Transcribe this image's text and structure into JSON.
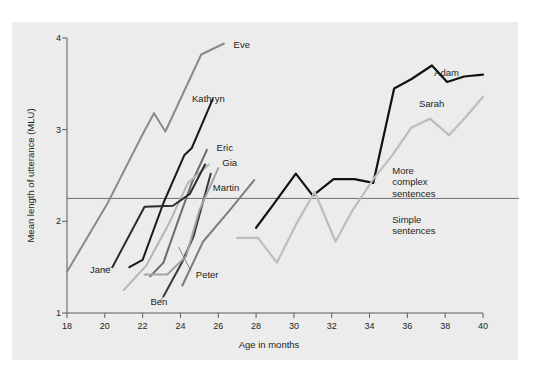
{
  "chart_data": {
    "type": "line",
    "title": "",
    "xlabel": "Age in months",
    "ylabel": "Mean length of utterance (MLU)",
    "xlim": [
      18,
      40
    ],
    "ylim": [
      1,
      4
    ],
    "xticks": [
      18,
      20,
      22,
      24,
      26,
      28,
      30,
      32,
      34,
      36,
      38,
      40
    ],
    "yticks": [
      1,
      2,
      3,
      4
    ],
    "grid": false,
    "legend": "inline-end-labels",
    "annotations": [
      {
        "text": "More\ncomplex\nsentences",
        "x": 35.2,
        "y": 2.55
      },
      {
        "text": "Simple\nsentences",
        "x": 35.2,
        "y": 2.02
      }
    ],
    "reference_lines": [
      {
        "orientation": "horizontal",
        "y": 2.25,
        "color": "#6d6d6d"
      }
    ],
    "series": [
      {
        "name": "Eve",
        "color": "#8a8a8a",
        "width": 2.0,
        "label_x": 26.6,
        "label_y": 3.92,
        "x": [
          18,
          20.1,
          22.0,
          22.6,
          23.2,
          25.1,
          26.3
        ],
        "y": [
          1.45,
          2.18,
          2.95,
          3.18,
          2.98,
          3.82,
          3.94
        ]
      },
      {
        "name": "Kathryn",
        "color": "#1a1a1a",
        "width": 2.0,
        "label_x": 24.4,
        "label_y": 3.33,
        "x": [
          21.3,
          22.0,
          23.1,
          24.2,
          24.6,
          25.7
        ],
        "y": [
          1.5,
          1.58,
          2.2,
          2.72,
          2.8,
          3.33
        ]
      },
      {
        "name": "Eric",
        "color": "#6b6b6b",
        "width": 2.0,
        "label_x": 25.7,
        "label_y": 2.8,
        "x": [
          22.4,
          23.1,
          23.9,
          24.6,
          25.4
        ],
        "y": [
          1.4,
          1.55,
          2.02,
          2.42,
          2.78
        ]
      },
      {
        "name": "Gia",
        "color": "#b5b5b5",
        "width": 2.0,
        "label_x": 26.0,
        "label_y": 2.64,
        "x": [
          21.0,
          22.2,
          23.4,
          24.4,
          25.5
        ],
        "y": [
          1.25,
          1.52,
          1.98,
          2.42,
          2.62
        ]
      },
      {
        "name": "Jane",
        "color": "#2c2c2c",
        "width": 2.0,
        "label_x": 19.0,
        "label_y": 1.47,
        "x": [
          20.4,
          22.1,
          23.6,
          24.5,
          25.3
        ],
        "y": [
          1.5,
          2.16,
          2.17,
          2.3,
          2.62
        ]
      },
      {
        "name": "Ben",
        "color": "#3a3a3a",
        "width": 2.0,
        "label_x": 22.2,
        "label_y": 1.12,
        "x": [
          23.1,
          24.1,
          24.7,
          25.6
        ],
        "y": [
          1.18,
          1.56,
          1.84,
          2.52
        ]
      },
      {
        "name": "Peter",
        "color": "#a3a3a3",
        "width": 2.0,
        "label_x": 24.6,
        "label_y": 1.42,
        "x": [
          22.1,
          23.3,
          24.3,
          25.0,
          26.0
        ],
        "y": [
          1.42,
          1.42,
          1.62,
          2.12,
          2.58
        ]
      },
      {
        "name": "Martin",
        "color": "#7d7d7d",
        "width": 2.0,
        "label_x": 25.5,
        "label_y": 2.36,
        "x": [
          24.1,
          25.2,
          26.6,
          27.9
        ],
        "y": [
          1.3,
          1.78,
          2.12,
          2.45
        ]
      },
      {
        "name": "Adam",
        "color": "#121212",
        "width": 2.2,
        "label_x": 37.2,
        "label_y": 3.62,
        "x": [
          28.0,
          28.9,
          30.1,
          31.0,
          32.1,
          33.2,
          34.2,
          35.3,
          36.2,
          37.3,
          38.1,
          39.0,
          40.0
        ],
        "y": [
          1.93,
          2.18,
          2.52,
          2.28,
          2.46,
          2.46,
          2.42,
          3.45,
          3.55,
          3.7,
          3.52,
          3.58,
          3.6
        ]
      },
      {
        "name": "Sarah",
        "color": "#bdbdbd",
        "width": 2.2,
        "label_x": 36.4,
        "label_y": 3.28,
        "x": [
          27.0,
          28.1,
          29.1,
          30.2,
          31.1,
          32.2,
          33.1,
          34.2,
          35.2,
          36.2,
          37.2,
          38.2,
          39.1,
          40.0
        ],
        "y": [
          1.82,
          1.82,
          1.55,
          2.0,
          2.32,
          1.78,
          2.12,
          2.46,
          2.72,
          3.02,
          3.12,
          2.94,
          3.14,
          3.36
        ]
      }
    ]
  }
}
